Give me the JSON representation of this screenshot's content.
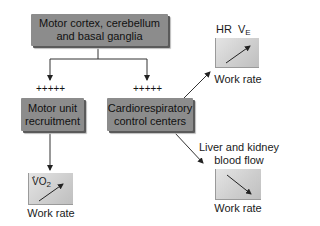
{
  "diagram": {
    "top_node": {
      "line1": "Motor cortex, cerebellum",
      "line2": "and basal ganglia"
    },
    "left_node": {
      "line1": "Motor unit",
      "line2": "recruitment"
    },
    "right_node": {
      "line1": "Cardiorespiratory",
      "line2": "control centers"
    },
    "left_plus": "+++++",
    "right_plus": "+++++",
    "chart_hr_ve": {
      "label_hr": "HR",
      "label_v": "V",
      "label_v_sub": "E",
      "xlabel": "Work rate",
      "trend": "increasing"
    },
    "chart_liver_kidney": {
      "title_line1": "Liver and kidney",
      "title_line2": "blood flow",
      "xlabel": "Work rate",
      "trend": "decreasing"
    },
    "chart_vo2": {
      "label_vo": "VO",
      "label_sub": "2",
      "xlabel": "Work rate",
      "trend": "increasing"
    },
    "colors": {
      "node_fill": "#8c8c8c",
      "mini_chart_fill": "#d0d0d0",
      "line": "#222222"
    }
  }
}
